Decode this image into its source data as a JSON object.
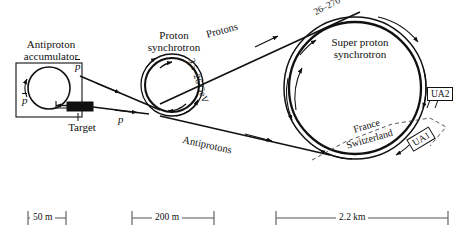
{
  "figure": {
    "background_color": "#ffffff",
    "line_color": "#111111"
  },
  "components": {
    "accumulator": {
      "label_line1": "Antiproton",
      "label_line2": "accumulator",
      "symbol_top": "p",
      "symbol_top_overbar": true,
      "symbol_left": "p",
      "symbol_left_overbar": true
    },
    "target": {
      "label": "Target",
      "incoming_symbol": "p",
      "incoming_overbar": false
    },
    "proton_synchrotron": {
      "label_line1": "Proton",
      "label_line2": "synchrotron",
      "energy": "3.5–26 GeV"
    },
    "super_proton_synchrotron": {
      "label_line1": "Super proton",
      "label_line2": "synchrotron",
      "energy": "26–270 GeV"
    },
    "detectors": [
      {
        "name": "UA2",
        "rotated": false
      },
      {
        "name": "UA1",
        "rotated": true
      }
    ],
    "border": {
      "country_a": "France",
      "country_b": "Switzerland"
    }
  },
  "beamlines": [
    {
      "name": "Protons",
      "direction": "right"
    },
    {
      "name": "Antiprotons",
      "direction": "right"
    }
  ],
  "scale_bars": [
    {
      "label": "50 m",
      "x": 28,
      "width": 38
    },
    {
      "label": "200 m",
      "x": 132,
      "width": 82
    },
    {
      "label": "2.2 km",
      "x": 276,
      "width": 172
    }
  ]
}
